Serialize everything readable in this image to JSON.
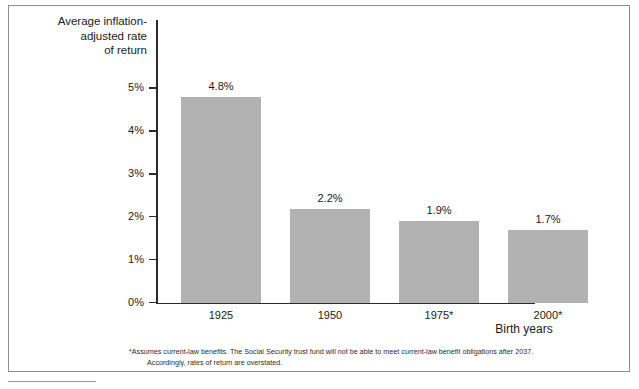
{
  "chart_data": {
    "type": "bar",
    "title": "Average inflation-\nadjusted rate\nof return",
    "ylabel": "Average inflation-adjusted rate of return",
    "xlabel": "Birth years",
    "categories": [
      "1925",
      "1950",
      "1975*",
      "2000*"
    ],
    "values": [
      4.8,
      2.2,
      1.9,
      1.7
    ],
    "value_labels": [
      "4.8%",
      "2.2%",
      "1.9%",
      "1.7%"
    ],
    "ylim": [
      0,
      5
    ],
    "yticks": [
      0,
      1,
      2,
      3,
      4,
      5
    ],
    "ytick_labels": [
      "0%",
      "1%",
      "2%",
      "3%",
      "4%",
      "5%"
    ],
    "grid": false,
    "legend": null,
    "bar_color": "#b2b2b2",
    "axis_color": "#2b2b2b",
    "text_color": "#1a1a1a"
  },
  "footnote": {
    "line_1": "*Assumes current-law benefits.  The Social Security trust fund will not be able to meet current-law benefit obligations after 2037.",
    "line_2": "Accordingly, rates of return are overstated."
  }
}
